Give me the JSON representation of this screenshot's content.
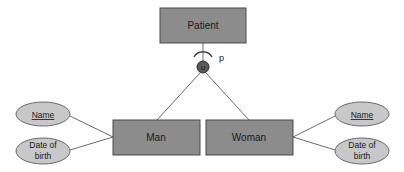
{
  "diagram": {
    "type": "ER specialization",
    "colors": {
      "entity_fill": "#8c8c8c",
      "entity_stroke": "#4a4a4a",
      "attribute_fill": "#c8c8c8",
      "attribute_stroke": "#6a6a6a",
      "line": "#6a6a6a",
      "union_fill": "#5a5a5a"
    },
    "parent": {
      "label": "Patient"
    },
    "specialization": {
      "symbol": "u",
      "constraint": "p"
    },
    "children": [
      {
        "label": "Man",
        "attributes": [
          {
            "label": "Name",
            "key": true
          },
          {
            "line1": "Date of",
            "line2": "birth",
            "key": false
          }
        ]
      },
      {
        "label": "Woman",
        "attributes": [
          {
            "label": "Name",
            "key": true
          },
          {
            "line1": "Date of",
            "line2": "birth",
            "key": false
          }
        ]
      }
    ]
  }
}
